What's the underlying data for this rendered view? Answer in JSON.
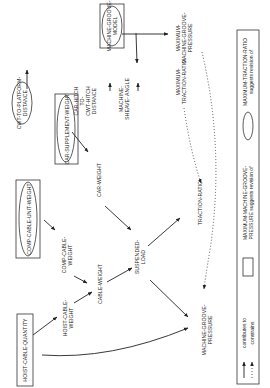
{
  "diagram": {
    "nodes": {
      "cwt_to_platform": [
        "CWT-TO-PLATFORM-",
        "DISTANCE"
      ],
      "car_hitch": [
        "CAR-HITCH",
        "TO-",
        "CWT-HITCH",
        "DISTANCE"
      ],
      "machine_groove_model": [
        "MACHINE-GROOVE-",
        "MODEL"
      ],
      "machine_sheave_angle": [
        "MACHINE-",
        "SHEAVE- ANGLE"
      ],
      "max_traction_ratio": [
        "MAXIMUM-",
        "TRACTION-RATIO"
      ],
      "max_machine_groove_pressure": [
        "MAXIMUM-",
        "MACHINE-GROOVE-",
        "PRESSURE"
      ],
      "car_supplement_weight": "CAR-SUPPLEMENT-WEIGHT",
      "comp_cable_unit_weight": "COMP-CABLE-UNIT-WEIGHT",
      "car_weight": "CAR-WEIGHT",
      "comp_cable_weight": [
        "COMP-CABLE-",
        "WEIGHT"
      ],
      "cable_weight": "CABLE-WEIGHT",
      "suspended_load": [
        "SUSPENDED-",
        "LOAD"
      ],
      "traction_ratio": "TRACTION-RATIO",
      "hoist_cable_quantity": "HOIST-CABLE-QUANTITY",
      "hoist_cable_weight": [
        "HOIST-CABLE-",
        "WEIGHT"
      ],
      "machine_groove_pressure": [
        "MACHINE-GROOVE-",
        "PRESSURE"
      ]
    },
    "legend": {
      "ellipse": [
        "MAXIMUM-TRACTION-RATIO",
        "suggests revision of"
      ],
      "rectangle": [
        "MAXIMUM-MACHINE-GROOVE-",
        "PRESSURE suggests revision of"
      ],
      "solid_arrow": "contributes to",
      "dotted_arrow": "constrains"
    }
  }
}
